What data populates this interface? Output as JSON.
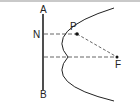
{
  "diagram": {
    "type": "parabola-focus-directrix",
    "labels": {
      "directrix_top": "A",
      "directrix_bottom": "B",
      "foot": "N",
      "point": "P",
      "focus": "F"
    },
    "colors": {
      "stroke": "#222222",
      "dashed": "#555555",
      "border": "#c9c9c9"
    }
  }
}
